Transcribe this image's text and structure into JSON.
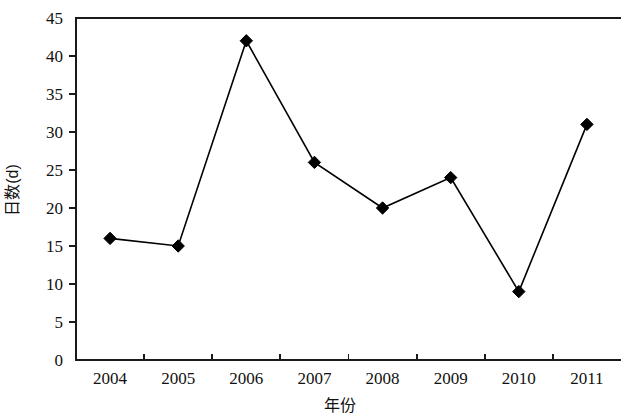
{
  "chart_data": {
    "type": "line",
    "title": "",
    "subtitle": "",
    "xlabel": "年份",
    "ylabel": "日数(d)",
    "categories": [
      "2004",
      "2005",
      "2006",
      "2007",
      "2008",
      "2009",
      "2010",
      "2011"
    ],
    "values": [
      16,
      15,
      42,
      26,
      20,
      24,
      9,
      31
    ],
    "series": [
      {
        "name": "日数",
        "values": [
          16,
          15,
          42,
          26,
          20,
          24,
          9,
          31
        ]
      }
    ],
    "ylim": [
      0,
      45
    ],
    "ytick_labels": [
      "0",
      "5",
      "10",
      "15",
      "20",
      "25",
      "30",
      "35",
      "40",
      "45"
    ],
    "ytick_values": [
      0,
      5,
      10,
      15,
      20,
      25,
      30,
      35,
      40,
      45
    ],
    "xtick_labels": [
      "2004",
      "2005",
      "2006",
      "2007",
      "2008",
      "2009",
      "2010",
      "2011"
    ],
    "grid": false,
    "legend": false,
    "legend_position": "none",
    "marker": "diamond",
    "line_color": "#000000",
    "marker_color": "#000000",
    "background_color": "#ffffff",
    "axis_color": "#1a1a1a",
    "annotations": []
  },
  "axes": {
    "y_title": "日数(d)",
    "x_title": "年份"
  },
  "y_ticks": [
    {
      "label": "45",
      "value": 45
    },
    {
      "label": "40",
      "value": 40
    },
    {
      "label": "35",
      "value": 35
    },
    {
      "label": "30",
      "value": 30
    },
    {
      "label": "25",
      "value": 25
    },
    {
      "label": "20",
      "value": 20
    },
    {
      "label": "15",
      "value": 15
    },
    {
      "label": "10",
      "value": 10
    },
    {
      "label": "5",
      "value": 5
    },
    {
      "label": "0",
      "value": 0
    }
  ],
  "x_ticks": [
    {
      "label": "2004",
      "value": 16
    },
    {
      "label": "2005",
      "value": 15
    },
    {
      "label": "2006",
      "value": 42
    },
    {
      "label": "2007",
      "value": 26
    },
    {
      "label": "2008",
      "value": 20
    },
    {
      "label": "2009",
      "value": 24
    },
    {
      "label": "2010",
      "value": 9
    },
    {
      "label": "2011",
      "value": 31
    }
  ]
}
